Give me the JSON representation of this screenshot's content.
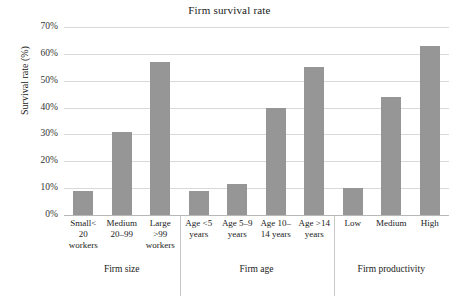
{
  "chart_data": {
    "type": "bar",
    "title": "Firm survival rate",
    "xlabel": "",
    "ylabel": "Survival rate (%)",
    "ylim": [
      0,
      70
    ],
    "ytick_labels": [
      "0%",
      "10%",
      "20%",
      "30%",
      "40%",
      "50%",
      "60%",
      "70%"
    ],
    "ytick_values": [
      0,
      10,
      20,
      30,
      40,
      50,
      60,
      70
    ],
    "grid": true,
    "legend": "none",
    "bar_color": "#969696",
    "categories": [
      "Small< 20 workers",
      "Medium 20–99",
      "Large >99 workers",
      "Age <5 years",
      "Age 5–9 years",
      "Age 10–14 years",
      "Age >14 years",
      "Low",
      "Medium",
      "High"
    ],
    "values": [
      9,
      31,
      57,
      9,
      11.5,
      40,
      55,
      10,
      44,
      63
    ],
    "groups": [
      {
        "label": "Firm size",
        "categories": [
          {
            "lines": [
              "Small<",
              "20",
              "workers"
            ],
            "value": 9
          },
          {
            "lines": [
              "Medium",
              "20–99"
            ],
            "value": 31
          },
          {
            "lines": [
              "Large",
              ">99",
              "workers"
            ],
            "value": 57
          }
        ]
      },
      {
        "label": "Firm age",
        "categories": [
          {
            "lines": [
              "Age <5",
              "years"
            ],
            "value": 9
          },
          {
            "lines": [
              "Age 5–9",
              "years"
            ],
            "value": 11.5
          },
          {
            "lines": [
              "Age 10–",
              "14 years"
            ],
            "value": 40
          },
          {
            "lines": [
              "Age >14",
              "years"
            ],
            "value": 55
          }
        ]
      },
      {
        "label": "Firm productivity",
        "categories": [
          {
            "lines": [
              "Low"
            ],
            "value": 10
          },
          {
            "lines": [
              "Medium"
            ],
            "value": 44
          },
          {
            "lines": [
              "High"
            ],
            "value": 63
          }
        ]
      }
    ]
  }
}
